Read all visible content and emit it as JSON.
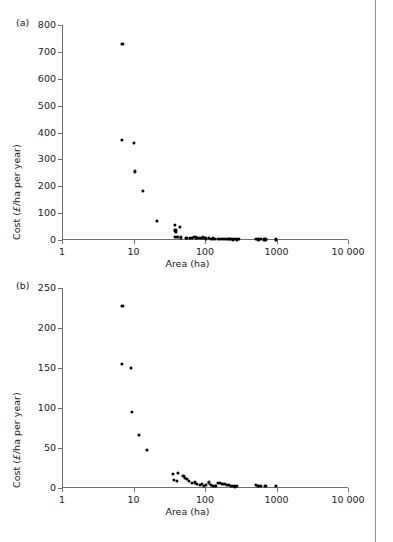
{
  "page": {
    "top_remnant": "",
    "rule_color": "#8e8e8e"
  },
  "chart_data": [
    {
      "type": "scatter",
      "panel": "(a)",
      "title": "",
      "xlabel": "Area (ha)",
      "ylabel": "Cost (£/ha per year)",
      "ylabel_prefix": "Cost (",
      "ylabel_italic": "£",
      "ylabel_suffix": "/ha per year)",
      "xscale": "log",
      "yscale": "linear",
      "xlim": [
        1,
        10000
      ],
      "ylim": [
        0,
        800
      ],
      "xticks": [
        1,
        10,
        100,
        1000,
        10000
      ],
      "xticklabels": [
        "1",
        "10",
        "100",
        "1000",
        "10 000"
      ],
      "yticks": [
        0,
        100,
        200,
        300,
        400,
        500,
        600,
        700,
        800
      ],
      "yticklabels": [
        "0",
        "100",
        "200",
        "300",
        "400",
        "500",
        "600",
        "700",
        "800"
      ],
      "grid": false,
      "legend": false,
      "marker": "filled-circle",
      "marker_color": "#000000",
      "points": [
        [
          7.0,
          730
        ],
        [
          6.8,
          373
        ],
        [
          10.2,
          361
        ],
        [
          10.6,
          255
        ],
        [
          13.5,
          183
        ],
        [
          21.0,
          70
        ],
        [
          38.0,
          55
        ],
        [
          44.0,
          48
        ],
        [
          38.5,
          36
        ],
        [
          39.5,
          30
        ],
        [
          38.0,
          13
        ],
        [
          41.0,
          11
        ],
        [
          46.0,
          10
        ],
        [
          55.0,
          8
        ],
        [
          62.0,
          9
        ],
        [
          66.0,
          7
        ],
        [
          70.0,
          11
        ],
        [
          74.0,
          10
        ],
        [
          78.0,
          8
        ],
        [
          83.0,
          9
        ],
        [
          88.0,
          7
        ],
        [
          93.0,
          10
        ],
        [
          99.0,
          8
        ],
        [
          104.0,
          6
        ],
        [
          112.0,
          7
        ],
        [
          120.0,
          5
        ],
        [
          128.0,
          6
        ],
        [
          137.0,
          4
        ],
        [
          150.0,
          5
        ],
        [
          163.0,
          4
        ],
        [
          172.0,
          3
        ],
        [
          185.0,
          4
        ],
        [
          196.0,
          3
        ],
        [
          207.0,
          3
        ],
        [
          219.0,
          4
        ],
        [
          232.0,
          3
        ],
        [
          246.0,
          2
        ],
        [
          262.0,
          3
        ],
        [
          278.0,
          2
        ],
        [
          295.0,
          3
        ],
        [
          520.0,
          3
        ],
        [
          560.0,
          2
        ],
        [
          610.0,
          3
        ],
        [
          660.0,
          2
        ],
        [
          700.0,
          2
        ],
        [
          980.0,
          2
        ]
      ]
    },
    {
      "type": "scatter",
      "panel": "(b)",
      "title": "",
      "xlabel": "Area (ha)",
      "ylabel": "Cost (£/ha per year)",
      "ylabel_prefix": "Cost (",
      "ylabel_italic": "£",
      "ylabel_suffix": "/ha per year)",
      "xscale": "log",
      "yscale": "linear",
      "xlim": [
        1,
        10000
      ],
      "ylim": [
        0,
        250
      ],
      "xticks": [
        1,
        10,
        100,
        1000,
        10000
      ],
      "xticklabels": [
        "1",
        "10",
        "100",
        "1000",
        "10 000"
      ],
      "yticks": [
        0,
        50,
        100,
        150,
        200,
        250
      ],
      "yticklabels": [
        "0",
        "50",
        "100",
        "150",
        "200",
        "250"
      ],
      "grid": false,
      "legend": false,
      "marker": "filled-circle",
      "marker_color": "#000000",
      "points": [
        [
          7.0,
          228
        ],
        [
          6.9,
          155
        ],
        [
          9.2,
          150
        ],
        [
          9.6,
          95
        ],
        [
          12.0,
          66
        ],
        [
          15.5,
          48
        ],
        [
          36.0,
          18
        ],
        [
          42.0,
          19
        ],
        [
          36.5,
          10
        ],
        [
          40.0,
          9
        ],
        [
          50.0,
          15
        ],
        [
          53.0,
          13
        ],
        [
          56.0,
          11
        ],
        [
          60.0,
          9
        ],
        [
          66.0,
          6
        ],
        [
          72.0,
          7
        ],
        [
          78.0,
          5
        ],
        [
          84.0,
          4
        ],
        [
          90.0,
          5
        ],
        [
          97.0,
          3
        ],
        [
          104.0,
          4
        ],
        [
          112.0,
          7
        ],
        [
          120.0,
          4
        ],
        [
          130.0,
          3
        ],
        [
          140.0,
          3
        ],
        [
          152.0,
          6
        ],
        [
          163.0,
          6
        ],
        [
          175.0,
          5
        ],
        [
          188.0,
          5
        ],
        [
          200.0,
          4
        ],
        [
          214.0,
          4
        ],
        [
          230.0,
          3
        ],
        [
          246.0,
          3
        ],
        [
          262.0,
          2
        ],
        [
          280.0,
          3
        ],
        [
          520.0,
          4
        ],
        [
          560.0,
          3
        ],
        [
          600.0,
          3
        ],
        [
          700.0,
          3
        ],
        [
          980.0,
          3
        ]
      ]
    }
  ]
}
